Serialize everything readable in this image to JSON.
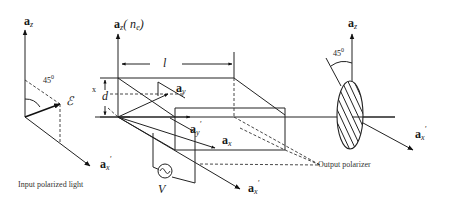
{
  "diagram": {
    "type": "electro-optic-modulator-schematic",
    "input": {
      "axis_z_label": "a",
      "axis_z_sub": "z",
      "axis_x_label": "a",
      "axis_x_sub": "x",
      "axis_x_prime": "′",
      "angle_label": "45",
      "angle_unit": "0",
      "field_label": "ℰ",
      "caption": "Input polarized light"
    },
    "crystal": {
      "axis_z_label": "a",
      "axis_z_sub": "z",
      "axis_z_paren": "( n",
      "axis_z_paren_sub": "e",
      "axis_z_paren_close": ")",
      "length_label": "l",
      "thickness_label": "d",
      "thickness_side": "x",
      "axis_y_label": "a",
      "axis_y_sub": "y",
      "axis_yp_label": "a",
      "axis_yp_sub": "y",
      "axis_yp_prime": "′",
      "axis_x_label": "a",
      "axis_x_sub": "x",
      "axis_xp_label": "a",
      "axis_xp_sub": "x",
      "axis_xp_prime": "′",
      "voltage_label": "V"
    },
    "output": {
      "axis_z_label": "a",
      "axis_z_sub": "z",
      "axis_x_label": "a",
      "axis_x_sub": "x",
      "axis_x_prime": "′",
      "angle_label": "45",
      "angle_unit": "0",
      "caption": "Output polarizer"
    }
  }
}
